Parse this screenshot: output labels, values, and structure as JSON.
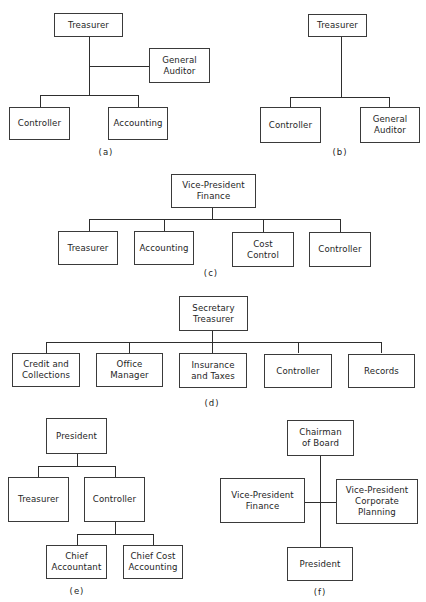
{
  "figure": {
    "panels": [
      {
        "id": "a",
        "caption": "(a)",
        "nodes": {
          "top": "Treasurer",
          "staff": "General\nAuditor",
          "child1": "Controller",
          "child2": "Accounting"
        }
      },
      {
        "id": "b",
        "caption": "(b)",
        "nodes": {
          "top": "Treasurer",
          "child1": "Controller",
          "child2": "General\nAuditor"
        }
      },
      {
        "id": "c",
        "caption": "(c)",
        "nodes": {
          "top": "Vice-President\nFinance",
          "child1": "Treasurer",
          "child2": "Accounting",
          "child3": "Cost\nControl",
          "child4": "Controller"
        }
      },
      {
        "id": "d",
        "caption": "(d)",
        "nodes": {
          "top": "Secretary\nTreasurer",
          "child1": "Credit and\nCollections",
          "child2": "Office\nManager",
          "child3": "Insurance\nand Taxes",
          "child4": "Controller",
          "child5": "Records"
        }
      },
      {
        "id": "e",
        "caption": "(e)",
        "nodes": {
          "top": "President",
          "child1": "Treasurer",
          "child2": "Controller",
          "grandchild1": "Chief\nAccountant",
          "grandchild2": "Chief Cost\nAccounting"
        }
      },
      {
        "id": "f",
        "caption": "(f)",
        "nodes": {
          "top": "Chairman\nof Board",
          "left": "Vice-President\nFinance",
          "right": "Vice-President\nCorporate\nPlanning",
          "bottom": "President"
        }
      }
    ]
  }
}
